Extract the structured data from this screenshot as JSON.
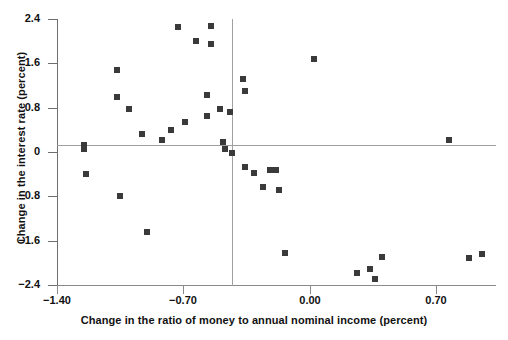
{
  "chart_data": {
    "type": "scatter",
    "title": "",
    "xlabel": "Change in the ratio of money to annual nominal income (percent)",
    "ylabel": "Change in the interest rate (percent)",
    "xlim": [
      -1.4,
      1.03
    ],
    "ylim": [
      -2.4,
      2.4
    ],
    "xticks": [
      -1.4,
      -0.7,
      0.0,
      0.7
    ],
    "xticklabels": [
      "-1.40",
      "-0.70",
      "0.00",
      "0.70"
    ],
    "yticks": [
      -2.4,
      -1.6,
      -0.8,
      0,
      0.8,
      1.6,
      2.4
    ],
    "yticklabels": [
      "-2.4",
      "-1.6",
      "-0.8",
      "0",
      "0.8",
      "1.6",
      "2.4"
    ],
    "grid": false,
    "legend": null,
    "reference_lines": [
      {
        "orientation": "horizontal",
        "value": 0.12
      },
      {
        "orientation": "vertical",
        "value": -0.43
      }
    ],
    "marker": {
      "shape": "square",
      "size": 6,
      "color": "#3a3a3a"
    },
    "points": [
      {
        "x": -1.25,
        "y": 0.13
      },
      {
        "x": -1.25,
        "y": 0.05
      },
      {
        "x": -1.24,
        "y": -0.4
      },
      {
        "x": -1.07,
        "y": 1.48
      },
      {
        "x": -1.07,
        "y": 0.99
      },
      {
        "x": -1.05,
        "y": -0.8
      },
      {
        "x": -1.0,
        "y": 0.78
      },
      {
        "x": -0.93,
        "y": 0.33
      },
      {
        "x": -0.9,
        "y": -1.44
      },
      {
        "x": -0.82,
        "y": 0.22
      },
      {
        "x": -0.77,
        "y": 0.4
      },
      {
        "x": -0.73,
        "y": 2.26
      },
      {
        "x": -0.69,
        "y": 0.54
      },
      {
        "x": -0.63,
        "y": 2.0
      },
      {
        "x": -0.57,
        "y": 1.03
      },
      {
        "x": -0.57,
        "y": 0.65
      },
      {
        "x": -0.55,
        "y": 2.27
      },
      {
        "x": -0.55,
        "y": 1.95
      },
      {
        "x": -0.5,
        "y": 0.78
      },
      {
        "x": -0.48,
        "y": 0.18
      },
      {
        "x": -0.47,
        "y": 0.05
      },
      {
        "x": -0.44,
        "y": 0.72
      },
      {
        "x": -0.43,
        "y": -0.02
      },
      {
        "x": -0.37,
        "y": 1.32
      },
      {
        "x": -0.36,
        "y": 1.1
      },
      {
        "x": -0.36,
        "y": -0.27
      },
      {
        "x": -0.31,
        "y": -0.38
      },
      {
        "x": -0.26,
        "y": -0.63
      },
      {
        "x": -0.22,
        "y": -0.32
      },
      {
        "x": -0.19,
        "y": -0.33
      },
      {
        "x": -0.17,
        "y": -0.68
      },
      {
        "x": -0.14,
        "y": -1.82
      },
      {
        "x": 0.02,
        "y": 1.67
      },
      {
        "x": 0.26,
        "y": -2.18
      },
      {
        "x": 0.33,
        "y": -2.12
      },
      {
        "x": 0.36,
        "y": -2.3
      },
      {
        "x": 0.4,
        "y": -1.9
      },
      {
        "x": 0.77,
        "y": 0.22
      },
      {
        "x": 0.88,
        "y": -1.92
      },
      {
        "x": 0.95,
        "y": -1.84
      }
    ]
  }
}
